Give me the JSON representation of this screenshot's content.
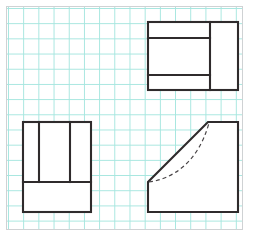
{
  "document": {
    "kind": "orthographic-projection-drawing",
    "medium": "graph-paper",
    "sheet_width": 255,
    "sheet_height": 239
  },
  "colors": {
    "page_background": "#ffffff",
    "paper_background": "#ffffff",
    "grid_line": "#a6e6df",
    "paper_frame": "#cfd2d4",
    "visible_edge": "#2f2b2c",
    "hidden_edge": "#4a4648"
  },
  "grid": {
    "spacing_px": 15.2,
    "columns": 15,
    "rows": 14,
    "visible": true
  },
  "paper_frame": {
    "x": 6,
    "y": 6,
    "width": 237,
    "height": 224
  },
  "views": [
    {
      "id": "top-view",
      "name": "top-view",
      "position": "upper-right",
      "outline": {
        "x": 148,
        "y": 22,
        "width": 90,
        "height": 68
      },
      "internal_lines": [
        {
          "kind": "horizontal",
          "name": "top-horizontal-divider",
          "x1": 148,
          "y1": 38,
          "x2": 210,
          "y2": 38
        },
        {
          "kind": "horizontal",
          "name": "lower-horizontal-divider",
          "x1": 148,
          "y1": 75,
          "x2": 210,
          "y2": 75
        },
        {
          "kind": "vertical",
          "name": "right-vertical-divider",
          "x1": 210,
          "y1": 22,
          "x2": 210,
          "y2": 90
        }
      ]
    },
    {
      "id": "front-view",
      "name": "front-view",
      "position": "lower-left",
      "outline": {
        "x": 23,
        "y": 122,
        "width": 68,
        "height": 90
      },
      "internal_lines": [
        {
          "kind": "vertical",
          "name": "left-vertical-divider",
          "x1": 39,
          "y1": 122,
          "x2": 39,
          "y2": 182
        },
        {
          "kind": "vertical",
          "name": "right-vertical-divider",
          "x1": 70,
          "y1": 122,
          "x2": 70,
          "y2": 182
        },
        {
          "kind": "horizontal",
          "name": "base-horizontal-divider",
          "x1": 23,
          "y1": 182,
          "x2": 91,
          "y2": 182
        }
      ]
    },
    {
      "id": "side-view",
      "name": "side-view",
      "position": "lower-right",
      "outline_points": "148,182 148,212 238,212 238,122 208,122 148,182",
      "bounds": {
        "x": 148,
        "y": 122,
        "width": 90,
        "height": 90
      },
      "features": [
        {
          "kind": "slanted-edge",
          "name": "chamfer-edge",
          "x1": 148,
          "y1": 182,
          "x2": 208,
          "y2": 122
        },
        {
          "kind": "hidden-curve",
          "name": "hidden-arc",
          "path": "M 149,182 C 172,179 198,163 209,123"
        }
      ]
    }
  ]
}
